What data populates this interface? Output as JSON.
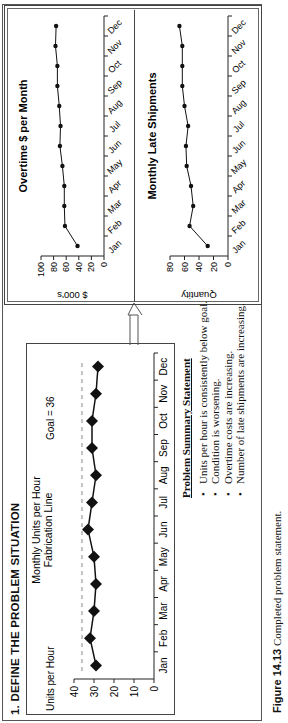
{
  "section_title": "1. DEFINE THE PROBLEM SITUATION",
  "uph_chart": {
    "title_line1": "Monthly Units per Hour",
    "title_line2": "Fabrication Line",
    "ylabel": "Units per Hour",
    "goal_label": "Goal = 36"
  },
  "overtime_chart": {
    "title": "Overtime $ per Month",
    "ylabel": "$ 000's"
  },
  "late_chart": {
    "title": "Monthly Late Shipments",
    "ylabel": "Quantity"
  },
  "summary": {
    "heading": "Problem Summary Statement",
    "items": [
      "Units per hour is consistently below goal.",
      "Condition is worsening.",
      "Overtime costs are increasing.",
      "Number of late shipments are increasing."
    ]
  },
  "caption": {
    "label": "Figure 14.13",
    "text": "Completed problem statement."
  },
  "chart_data": [
    {
      "type": "line",
      "title": "Monthly Units per Hour — Fabrication Line",
      "xlabel": "",
      "ylabel": "Units per Hour",
      "categories": [
        "Jan",
        "Feb",
        "Mar",
        "Apr",
        "May",
        "Jun",
        "Jul",
        "Aug",
        "Sep",
        "Oct",
        "Nov",
        "Dec"
      ],
      "values": [
        29,
        32,
        30,
        29,
        30,
        33,
        31,
        29,
        31,
        31,
        29,
        28
      ],
      "ylim": [
        0,
        40
      ],
      "yticks": [
        0,
        10,
        20,
        30,
        40
      ],
      "goal_line": 36,
      "annotations": [
        "Goal = 36"
      ],
      "grid": false
    },
    {
      "type": "line",
      "title": "Overtime $ per Month",
      "ylabel": "$ 000's",
      "categories": [
        "Jan",
        "Feb",
        "Mar",
        "Apr",
        "May",
        "Jun",
        "Jul",
        "Aug",
        "Sep",
        "Oct",
        "Nov",
        "Dec"
      ],
      "values": [
        42,
        62,
        63,
        63,
        66,
        70,
        69,
        71,
        74,
        74,
        77,
        76
      ],
      "ylim": [
        0,
        100
      ],
      "yticks": [
        0,
        20,
        40,
        60,
        80,
        100
      ],
      "grid": false
    },
    {
      "type": "line",
      "title": "Monthly Late Shipments",
      "ylabel": "Quantity",
      "categories": [
        "Jan",
        "Feb",
        "Mar",
        "Apr",
        "May",
        "Jun",
        "Jul",
        "Aug",
        "Sep",
        "Oct",
        "Nov",
        "Dec"
      ],
      "values": [
        28,
        53,
        48,
        51,
        57,
        58,
        55,
        60,
        63,
        63,
        63,
        67
      ],
      "ylim": [
        0,
        80
      ],
      "yticks": [
        0,
        20,
        40,
        60,
        80
      ],
      "grid": false
    }
  ]
}
